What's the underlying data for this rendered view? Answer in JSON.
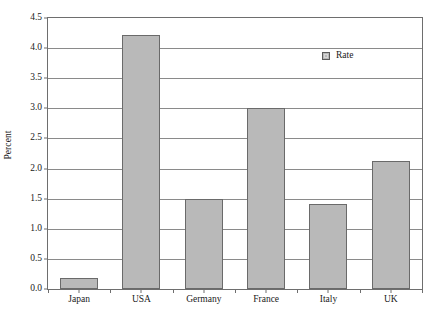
{
  "chart_data": {
    "type": "bar",
    "title": "",
    "subtitle": "",
    "xlabel": "",
    "ylabel": "Percent",
    "categories": [
      "Japan",
      "USA",
      "Germany",
      "France",
      "Italy",
      "UK"
    ],
    "values": [
      0.18,
      4.22,
      1.5,
      3.01,
      1.42,
      2.13
    ],
    "series": [
      {
        "name": "Rate",
        "values": [
          0.18,
          4.22,
          1.5,
          3.01,
          1.42,
          2.13
        ]
      }
    ],
    "ylim": [
      0.0,
      4.5
    ],
    "ytick_labels": [
      "0.0",
      "0.5",
      "1.0",
      "1.5",
      "2.0",
      "2.5",
      "3.0",
      "3.5",
      "4.0",
      "4.5"
    ],
    "ytick_values": [
      0.0,
      0.5,
      1.0,
      1.5,
      2.0,
      2.5,
      3.0,
      3.5,
      4.0,
      4.5
    ],
    "grid": true,
    "grid_axis": "y",
    "legend": {
      "position": "top-right-inside",
      "entries": [
        "Rate"
      ]
    },
    "colors": {
      "bar_fill": "#b9b9b9",
      "bar_edge": "#6a6a6a",
      "gridline": "#8a8a8a",
      "frame": "#6e6e6e",
      "text": "#1a1a1a"
    }
  },
  "legend": {
    "label": "Rate",
    "swatch_icon": "legend-square-icon"
  },
  "axes": {
    "y_title": "Percent"
  },
  "caption": {
    "text": ""
  }
}
